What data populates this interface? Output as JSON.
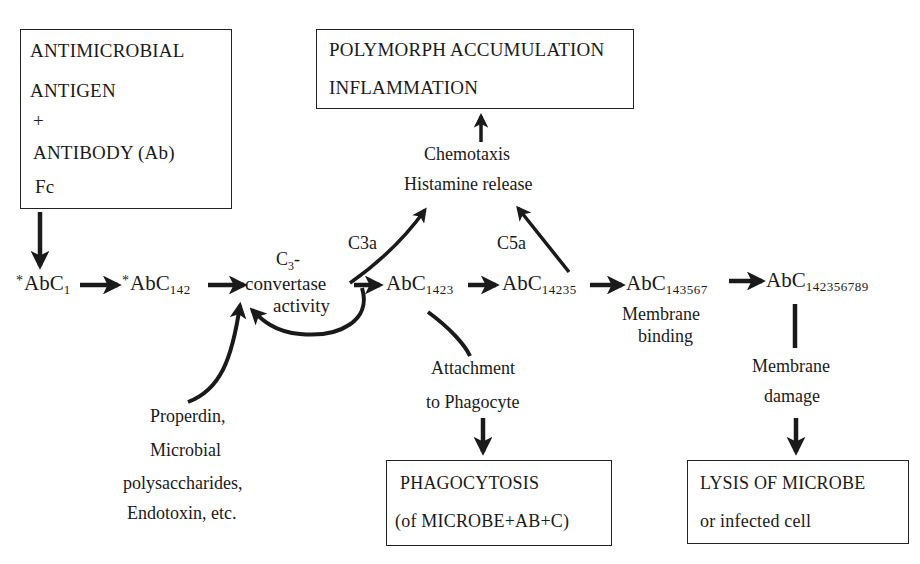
{
  "diagram": {
    "title_fragment": "",
    "boxes": {
      "antigen_antibody": {
        "lines": [
          "ANTIMICROBIAL",
          "ANTIGEN",
          "+",
          "ANTIBODY (Ab)",
          "Fc"
        ]
      },
      "polymorph": {
        "lines": [
          "POLYMORPH ACCUMULATION",
          "INFLAMMATION"
        ]
      },
      "phagocytosis": {
        "lines": [
          "PHAGOCYTOSIS",
          "(of MICROBE+AB+C)"
        ]
      },
      "lysis": {
        "lines": [
          "LYSIS OF MICROBE",
          "or infected cell"
        ]
      }
    },
    "nodes": [
      {
        "id": "abc1",
        "prefix": "*",
        "base": "AbC",
        "sub": "1"
      },
      {
        "id": "abc142",
        "prefix": "*",
        "base": "AbC",
        "sub": "142"
      },
      {
        "id": "abc1423",
        "prefix": "",
        "base": "AbC",
        "sub": "1423"
      },
      {
        "id": "abc14235",
        "prefix": "",
        "base": "AbC",
        "sub": "14235"
      },
      {
        "id": "abc143567",
        "prefix": "",
        "base": "AbC",
        "sub": "143567"
      },
      {
        "id": "abc142356789",
        "prefix": "",
        "base": "AbC",
        "sub": "142356789"
      }
    ],
    "convertase": {
      "top": "C",
      "top_sub": "3",
      "top_suffix": "-",
      "line2": "convertase",
      "line3": "activity"
    },
    "labels": {
      "chemotaxis": "Chemotaxis",
      "histamine": "Histamine release",
      "c3a": "C3a",
      "c5a": "C5a",
      "membrane_binding_1": "Membrane",
      "membrane_binding_2": "binding",
      "attachment_1": "Attachment",
      "attachment_2": "to Phagocyte",
      "membrane_damage_1": "Membrane",
      "membrane_damage_2": "damage",
      "properdin_1": "Properdin,",
      "properdin_2": "Microbial",
      "properdin_3": "polysaccharides,",
      "properdin_4": "Endotoxin, etc."
    },
    "colors": {
      "ink": "#1a1a1a",
      "background": "#ffffff"
    }
  }
}
